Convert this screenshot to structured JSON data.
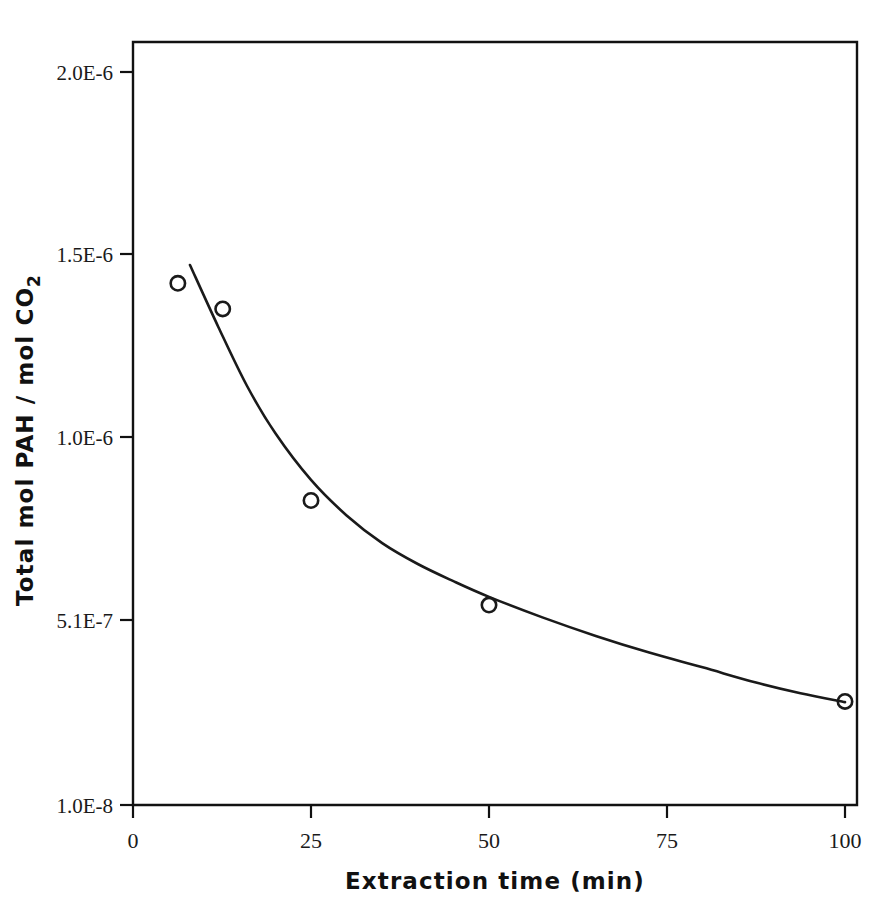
{
  "chart_data": {
    "type": "scatter",
    "title": "",
    "subtitle": "",
    "xlabel": "Extraction time (min)",
    "ylabel": "Total mol PAH / mol CO2",
    "ylabel_main": "Total mol PAH / mol CO",
    "ylabel_sub": "2",
    "xlim": [
      0,
      100
    ],
    "ylim": [
      1e-08,
      2.06e-06
    ],
    "grid": false,
    "legend": "none",
    "xticks": [
      0,
      25,
      50,
      75,
      100
    ],
    "xticklabels": [
      "0",
      "25",
      "50",
      "75",
      "100"
    ],
    "yticks": [
      2e-06,
      1.5e-06,
      1e-06,
      5.1e-07,
      1e-08
    ],
    "yticklabels": [
      "2.0E-6",
      "1.5E-6",
      "1.0E-6",
      "5.1E-7",
      "1.0E-8"
    ],
    "marker": "open-circle",
    "x": [
      6.3,
      12.6,
      25,
      50,
      100
    ],
    "values": [
      1.42e-06,
      1.35e-06,
      8.3e-07,
      5.5e-07,
      2.9e-07
    ],
    "points": [
      {
        "x": 6.3,
        "y": 1.42e-06,
        "label": "1.42E-6"
      },
      {
        "x": 12.6,
        "y": 1.35e-06,
        "label": "1.35E-6"
      },
      {
        "x": 25,
        "y": 8.3e-07,
        "label": "8.3E-7"
      },
      {
        "x": 50,
        "y": 5.5e-07,
        "label": "5.5E-7"
      },
      {
        "x": 100,
        "y": 2.9e-07,
        "label": "2.9E-7"
      }
    ],
    "fit_curve": {
      "name": "fitted decay curve",
      "x": [
        8.0,
        12,
        16,
        20,
        25,
        30,
        35,
        40,
        45,
        50,
        57.5,
        65,
        72.5,
        80,
        87.5,
        93.75,
        100
      ],
      "y": [
        1.47e-06,
        1.3e-06,
        1.14e-06,
        1.01e-06,
        8.85e-07,
        7.9e-07,
        7.16e-07,
        6.6e-07,
        6.14e-07,
        5.72e-07,
        5.17e-07,
        4.67e-07,
        4.22e-07,
        3.82e-07,
        3.41e-07,
        3.12e-07,
        2.88e-07
      ]
    },
    "colors": {
      "axis": "#111111",
      "curve": "#1a1a1a",
      "marker": "#1a1a1a",
      "background": "#ffffff"
    }
  }
}
